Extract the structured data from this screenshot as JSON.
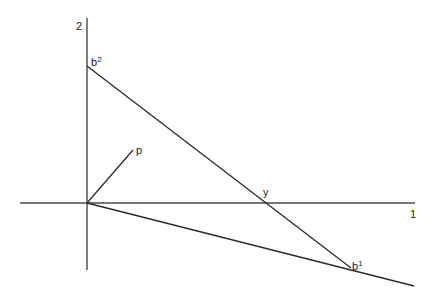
{
  "diagram": {
    "type": "vector-geometry",
    "colors": {
      "line": "#2a2a2a",
      "axis": "#4a4a4a",
      "text": "#222222",
      "background": "#ffffff"
    },
    "axes": {
      "vertical": {
        "label": "2",
        "x": 87,
        "y1": 18,
        "y2": 270
      },
      "horizontal": {
        "label": "1",
        "y": 203,
        "x1": 20,
        "x2": 415
      }
    },
    "origin": {
      "x": 87,
      "y": 203
    },
    "points": {
      "b2": {
        "base": "b",
        "sup": "2",
        "x": 87,
        "y": 66
      },
      "b1": {
        "base": "b",
        "sup": "1",
        "x": 351,
        "y": 268
      },
      "p": {
        "label": "p",
        "x": 133,
        "y": 150
      },
      "y": {
        "label": "y",
        "x": 262,
        "y": 203
      }
    },
    "segments": [
      {
        "name": "b2-to-b1",
        "from": "b2",
        "to": "b1"
      },
      {
        "name": "origin-to-p",
        "from": "origin",
        "to": "p"
      },
      {
        "name": "origin-through-b1",
        "from": "origin",
        "to_x": 414,
        "to_y": 286
      }
    ]
  }
}
